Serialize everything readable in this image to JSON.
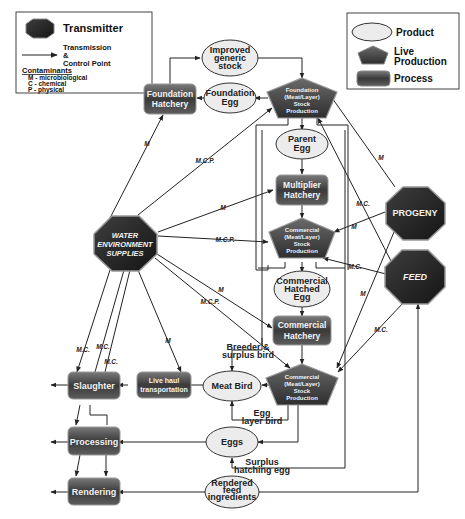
{
  "legend_left": {
    "transmitter_label": "Transmitter",
    "transmission_label_1": "Transmission",
    "transmission_label_2": "&",
    "transmission_label_3": "Control Point",
    "contaminants_title": "Contaminants",
    "contaminants": [
      "M - microbiological",
      "C - chemical",
      "P - physical"
    ]
  },
  "legend_right": {
    "product_label": "Product",
    "live_production_label_1": "Live",
    "live_production_label_2": "Production",
    "process_label": "Process"
  },
  "nodes": {
    "improved_generic_stock": [
      "Improved",
      "generic",
      "stock"
    ],
    "foundation_egg": [
      "Foundation",
      "Egg"
    ],
    "foundation_hatchery": [
      "Foundation",
      "Hatchery"
    ],
    "foundation_stock_production": [
      "Foundation",
      "(Meat/Layer)",
      "Stock",
      "Production"
    ],
    "parent_egg": [
      "Parent",
      "Egg"
    ],
    "multiplier_hatchery": [
      "Multiplier",
      "Hatchery"
    ],
    "commercial_stock_production_1": [
      "Commercial",
      "(Meat/Layer)",
      "Stock",
      "Production"
    ],
    "commercial_hatched_egg": [
      "Commercial",
      "Hatched",
      "Egg"
    ],
    "commercial_hatchery": [
      "Commercial",
      "Hatchery"
    ],
    "commercial_stock_production_2": [
      "Commercial",
      "(Meat/Layer)",
      "Stock",
      "Production"
    ],
    "water_environment_supplies": [
      "WATER",
      "ENVIRONMENT",
      "SUPPLIES"
    ],
    "progeny": "PROGENY",
    "feed": "FEED",
    "meat_bird": "Meat Bird",
    "eggs": "Eggs",
    "rendered_feed_ingredients": [
      "Rendered",
      "feed",
      "ingredients"
    ],
    "live_haul_transportation": [
      "Live haul",
      "transportation"
    ],
    "slaughter": "Slaughter",
    "processing": "Processing",
    "rendering": "Rendering"
  },
  "flow_labels": {
    "breeder_surplus_bird": [
      "Breeder &",
      "surplus bird"
    ],
    "egg_layer_bird": [
      "Egg",
      "layer bird"
    ],
    "surplus_hatching_egg": [
      "Surplus",
      "hatching egg"
    ]
  },
  "edge_labels": {
    "water_to_foundation_hatchery": "M",
    "water_to_foundation_stock": "M.C.P.",
    "water_to_multiplier": "M",
    "water_to_commercial_stock_1": "M.C.P.",
    "water_to_commercial_hatchery": "M",
    "water_to_commercial_stock_2": "M.C.P.",
    "water_to_slaughter_1": "M.C.",
    "water_to_slaughter_2": "M.C.",
    "water_to_slaughter_3": "M.C.",
    "water_to_live_haul": "M",
    "progeny_to_foundation": "M",
    "progeny_to_commercial_1": "M",
    "progeny_to_commercial_2": "M",
    "feed_to_foundation": "M.C.",
    "feed_to_commercial_1": "M.C.",
    "feed_to_commercial_2": "M.C."
  },
  "colors": {
    "process_fill_top": "#6a6a6a",
    "process_fill_bottom": "#2a2a2a",
    "product_fill": "#ececec",
    "transmitter_fill": "#2b2b2b",
    "line": "#222222"
  }
}
